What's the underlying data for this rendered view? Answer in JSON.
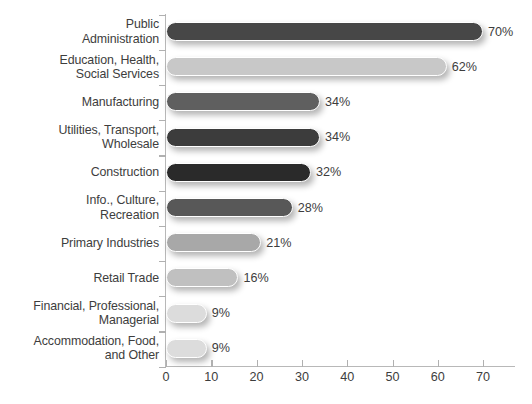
{
  "chart_data": {
    "type": "bar",
    "orientation": "horizontal",
    "title": "",
    "xlabel": "",
    "ylabel": "",
    "xlim": [
      0,
      77
    ],
    "grid": false,
    "legend": null,
    "value_suffix": "%",
    "categories": [
      "Public\nAdministration",
      "Education, Health,\nSocial Services",
      "Manufacturing",
      "Utilities, Transport,\nWholesale",
      "Construction",
      "Info., Culture,\nRecreation",
      "Primary Industries",
      "Retail Trade",
      "Financial, Professional,\nManagerial",
      "Accommodation, Food,\nand Other"
    ],
    "values": [
      70,
      62,
      34,
      34,
      32,
      28,
      21,
      16,
      9,
      9
    ],
    "value_labels": [
      "70%",
      "62%",
      "34%",
      "34%",
      "32%",
      "28%",
      "21%",
      "16%",
      "9%",
      "9%"
    ],
    "bar_colors": [
      "#474747",
      "#c8c8c8",
      "#5f5f5f",
      "#3c3c3c",
      "#2a2a2a",
      "#585858",
      "#a8a8a8",
      "#c0c0c0",
      "#dcdcdc",
      "#dcdcdc"
    ],
    "xticks": [
      0,
      10,
      20,
      30,
      40,
      50,
      60,
      70
    ],
    "xtick_labels": [
      "0",
      "10",
      "20",
      "30",
      "40",
      "50",
      "60",
      "70"
    ]
  },
  "footer": {
    "note": ""
  },
  "style": {
    "axis_color": "#b8b8b8",
    "text_color": "#3d3d3d",
    "background": "#ffffff"
  }
}
